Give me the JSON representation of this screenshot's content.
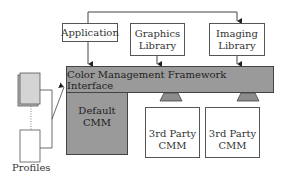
{
  "diagram": {
    "type": "architecture-block-diagram",
    "nodes": {
      "application": {
        "label": "Application"
      },
      "graphics_library": {
        "label_line1": "Graphics",
        "label_line2": "Library"
      },
      "imaging_library": {
        "label_line1": "Imaging",
        "label_line2": "Library"
      },
      "framework": {
        "label": "Color Management Framework Interface"
      },
      "default_cmm": {
        "label_line1": "Default",
        "label_line2": "CMM"
      },
      "third_party_cmm_1": {
        "label_line1": "3rd Party",
        "label_line2": "CMM"
      },
      "third_party_cmm_2": {
        "label_line1": "3rd Party",
        "label_line2": "CMM"
      },
      "profiles": {
        "label": "Profiles"
      }
    },
    "edges": [
      {
        "from": "application",
        "to": "graphics_library"
      },
      {
        "from": "application",
        "to": "imaging_library"
      },
      {
        "from": "application",
        "to": "framework"
      },
      {
        "from": "graphics_library",
        "to": "framework"
      },
      {
        "from": "imaging_library",
        "to": "framework"
      },
      {
        "from": "profiles",
        "to": "framework"
      },
      {
        "from": "third_party_cmm_1",
        "to": "framework",
        "style": "plug-in"
      },
      {
        "from": "third_party_cmm_2",
        "to": "framework",
        "style": "plug-in"
      }
    ],
    "colors": {
      "framework_fill": "#9a9a9a",
      "default_cmm_fill": "#9a9a9a",
      "profile_fill": "#d4d4d4",
      "stroke": "#444444"
    }
  }
}
